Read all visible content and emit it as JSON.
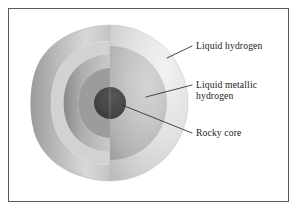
{
  "figure": {
    "type": "cutaway-cross-section",
    "frame": {
      "border_color": "#5a5a5a",
      "background_color": "#ffffff"
    },
    "sphere": {
      "center_x": 110,
      "center_y": 103,
      "radius": 78,
      "cutaway": "front-left quarter wedge removed revealing concentric layers"
    },
    "layers": [
      {
        "id": "liquid-hydrogen",
        "name": "Liquid hydrogen",
        "order": 1,
        "position": "outer shell",
        "outer_radius": 78,
        "inner_radius": 57,
        "color_light": "#e6e6e6",
        "color_shadow": "#b4b4b4"
      },
      {
        "id": "liquid-metallic-hydrogen",
        "name": "Liquid metallic hydrogen",
        "order": 2,
        "position": "middle shell",
        "outer_radius": 57,
        "inner_radius": 16,
        "color_light": "#c8c8c8",
        "color_shadow": "#8f8f8f"
      },
      {
        "id": "rocky-core",
        "name": "Rocky core",
        "order": 3,
        "position": "center",
        "outer_radius": 16,
        "inner_radius": 0,
        "color_light": "#4a4a4a",
        "color_shadow": "#3a3a3a"
      }
    ],
    "callouts": [
      {
        "id": "callout-liquid-hydrogen",
        "lines": [
          "Liquid hydrogen"
        ],
        "text_x": 196,
        "text_y": 49,
        "leader_from_x": 167,
        "leader_from_y": 58,
        "leader_to_x": 192,
        "leader_to_y": 46
      },
      {
        "id": "callout-liquid-metallic-hydrogen",
        "lines": [
          "Liquid metallic",
          "hydrogen"
        ],
        "text_x": 196,
        "text_y": 88,
        "leader_from_x": 146,
        "leader_from_y": 97,
        "leader_to_x": 192,
        "leader_to_y": 85
      },
      {
        "id": "callout-rocky-core",
        "lines": [
          "Rocky core"
        ],
        "text_x": 196,
        "text_y": 136,
        "leader_from_x": 122,
        "leader_from_y": 105,
        "leader_to_x": 192,
        "leader_to_y": 133
      }
    ],
    "leader_line_color": "#2a2a2a",
    "text_color": "#1a1a1a"
  }
}
